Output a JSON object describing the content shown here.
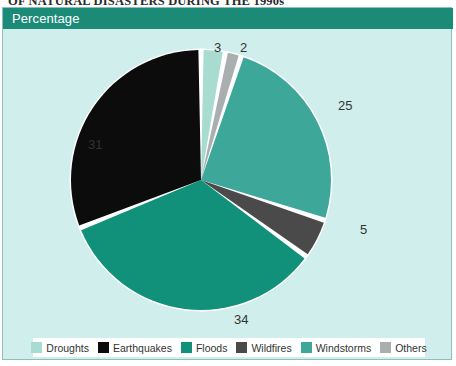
{
  "title": "OF NATURAL DISASTERS DURING THE 1990s",
  "header": {
    "label": "Percentage"
  },
  "colors": {
    "background": "#cfeeec",
    "panel_border": "#8cbfbd",
    "header_band": "#1b8a77",
    "header_text": "#ffffff",
    "slice_gap": "#ffffff",
    "label_text": "#333333",
    "legend_background": "#ffffff"
  },
  "chart_data": {
    "type": "pie",
    "title": "OF NATURAL DISASTERS DURING THE 1990s",
    "subtitle": "Percentage",
    "xlabel": "",
    "ylabel": "",
    "grid": false,
    "legend_position": "bottom",
    "units": "percent",
    "total": 100,
    "start_angle_deg": 0,
    "direction": "clockwise",
    "categories": [
      "Droughts",
      "Others",
      "Windstorms",
      "Wildfires",
      "Floods",
      "Earthquakes"
    ],
    "values": [
      3,
      2,
      25,
      5,
      34,
      31
    ],
    "slices": [
      {
        "label": "Droughts",
        "value": 3,
        "color": "#a8dcd0",
        "label_x": 206,
        "label_y": 8
      },
      {
        "label": "Others",
        "value": 2,
        "color": "#a9aeae",
        "label_x": 232,
        "label_y": 8
      },
      {
        "label": "Windstorms",
        "value": 25,
        "color": "#3da89a",
        "label_x": 330,
        "label_y": 66
      },
      {
        "label": "Wildfires",
        "value": 5,
        "color": "#4a4a4a",
        "label_x": 352,
        "label_y": 190
      },
      {
        "label": "Floods",
        "value": 34,
        "color": "#11917a",
        "label_x": 226,
        "label_y": 280
      },
      {
        "label": "Earthquakes",
        "value": 31,
        "color": "#0c0c0c",
        "label_x": 80,
        "label_y": 105
      }
    ]
  },
  "legend": {
    "items": [
      {
        "label": "Droughts",
        "color": "#a8dcd0"
      },
      {
        "label": "Earthquakes",
        "color": "#0c0c0c"
      },
      {
        "label": "Floods",
        "color": "#11917a"
      },
      {
        "label": "Wildfires",
        "color": "#4a4a4a"
      },
      {
        "label": "Windstorms",
        "color": "#3da89a"
      },
      {
        "label": "Others",
        "color": "#a9aeae"
      }
    ]
  }
}
